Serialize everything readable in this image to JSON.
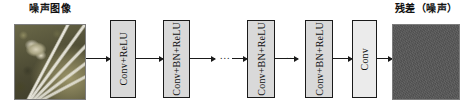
{
  "diagram": {
    "input": {
      "caption": "噪声图像",
      "image_name": "noisy-butterfly-image"
    },
    "output": {
      "caption": "残差（噪声）",
      "image_name": "residual-noise-image",
      "color": "#575757"
    },
    "layers": [
      {
        "id": "conv-relu",
        "label": "Conv+ReLU",
        "fill": "#d9d9d9"
      },
      {
        "id": "conv-bn-relu-1",
        "label": "Conv+BN+ReLU",
        "fill": "#d9d9d9"
      },
      {
        "id": "conv-bn-relu-2",
        "label": "Conv+BN+ReLU",
        "fill": "#d9d9d9"
      },
      {
        "id": "conv-bn-relu-3",
        "label": "Conv+BN+ReLU",
        "fill": "#d9d9d9"
      },
      {
        "id": "conv",
        "label": "Conv",
        "fill": "#ebebeb"
      }
    ],
    "ellipses": [
      {
        "text": "..."
      },
      {
        "text": "..."
      }
    ],
    "arrows": [
      {
        "from": "noisy-image",
        "to": "conv-relu"
      },
      {
        "from": "conv-relu",
        "to": "conv-bn-relu-1"
      },
      {
        "from": "conv-bn-relu-1",
        "to": "ellipsis-1"
      },
      {
        "from": "ellipsis-1",
        "to": "conv-bn-relu-2"
      },
      {
        "from": "conv-bn-relu-2",
        "to": "ellipsis-2"
      },
      {
        "from": "conv-bn-relu-3",
        "to": "conv"
      },
      {
        "from": "conv",
        "to": "residual-image"
      }
    ]
  }
}
